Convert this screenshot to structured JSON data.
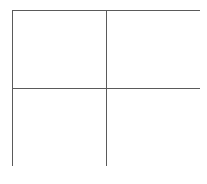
{
  "diagram": {
    "type": "grid",
    "rows": 2,
    "columns": 2,
    "line_color": "#5a5a5a",
    "background_color": "#ffffff",
    "cells": [
      {
        "row": 0,
        "col": 0,
        "label": ""
      },
      {
        "row": 0,
        "col": 1,
        "label": ""
      },
      {
        "row": 1,
        "col": 0,
        "label": ""
      },
      {
        "row": 1,
        "col": 1,
        "label": ""
      }
    ]
  }
}
